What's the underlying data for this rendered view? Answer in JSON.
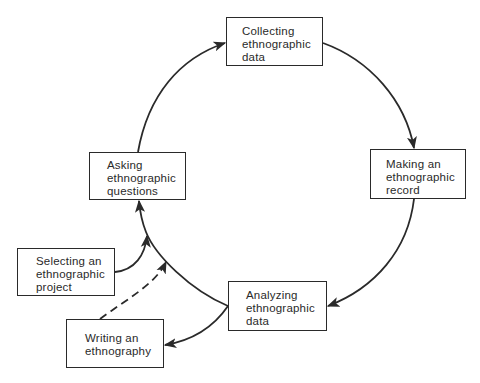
{
  "diagram": {
    "type": "cycle",
    "nodes": [
      {
        "id": "collecting",
        "lines": [
          "Collecting",
          "ethnographic",
          "data"
        ]
      },
      {
        "id": "making",
        "lines": [
          "Making an",
          "ethnographic",
          "record"
        ]
      },
      {
        "id": "analyzing",
        "lines": [
          "Analyzing",
          "ethnographic",
          "data"
        ]
      },
      {
        "id": "asking",
        "lines": [
          "Asking",
          "ethnographic",
          "questions"
        ]
      },
      {
        "id": "selecting",
        "lines": [
          "Selecting an",
          "ethnographic",
          "project"
        ]
      },
      {
        "id": "writing",
        "lines": [
          "Writing an",
          "ethnography"
        ]
      }
    ],
    "edges": [
      {
        "from": "asking",
        "to": "collecting",
        "style": "solid"
      },
      {
        "from": "collecting",
        "to": "making",
        "style": "solid"
      },
      {
        "from": "making",
        "to": "analyzing",
        "style": "solid"
      },
      {
        "from": "analyzing",
        "to": "asking",
        "style": "solid"
      },
      {
        "from": "selecting",
        "to": "asking",
        "style": "solid"
      },
      {
        "from": "analyzing",
        "to": "writing",
        "style": "solid"
      },
      {
        "from": "writing",
        "to": "asking",
        "style": "dashed"
      }
    ],
    "colors": {
      "line": "#2a2a2a",
      "background": "#ffffff"
    }
  }
}
